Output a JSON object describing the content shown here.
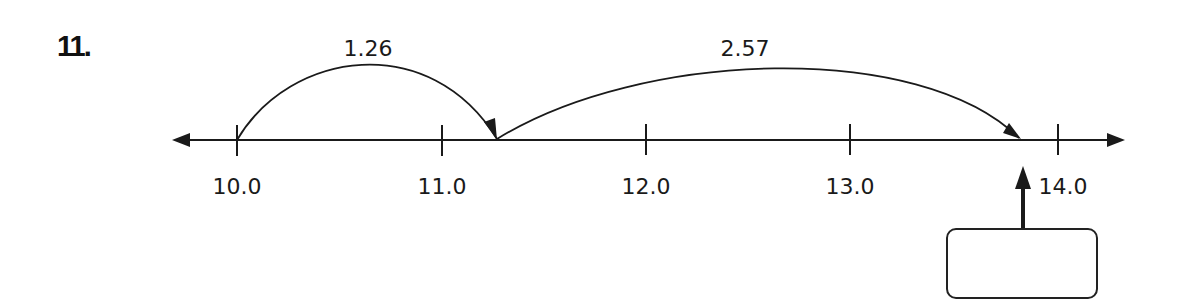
{
  "problem": {
    "number": "11.",
    "jumps": [
      {
        "label": "1.26",
        "from": 10.0,
        "to": 11.26
      },
      {
        "label": "2.57",
        "from": 11.26,
        "to": 13.83
      }
    ],
    "ticks": [
      "10.0",
      "11.0",
      "12.0",
      "13.0",
      "14.0"
    ],
    "answer_box": {
      "value": ""
    },
    "colors": {
      "ink": "#1a1a1a",
      "background": "#ffffff"
    }
  }
}
